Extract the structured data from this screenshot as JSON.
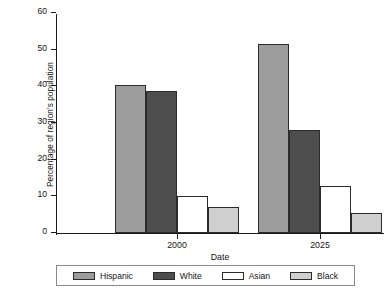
{
  "chart_data": {
    "type": "bar",
    "title": "",
    "xlabel": "Date",
    "ylabel": "Percentage of region's population",
    "categories": [
      "2000",
      "2025"
    ],
    "ylim": [
      0,
      60
    ],
    "yticks": [
      0,
      10,
      20,
      30,
      40,
      50,
      60
    ],
    "ytick_labels": [
      "0",
      "10",
      "20",
      "30",
      "40",
      "50",
      "60"
    ],
    "grid": false,
    "legend_position": "bottom",
    "series": [
      {
        "name": "Hispanic",
        "color": "#9d9d9d",
        "values": [
          40.5,
          51.5
        ]
      },
      {
        "name": "White",
        "color": "#4d4d4d",
        "values": [
          38.8,
          28.2
        ]
      },
      {
        "name": "Asian",
        "color": "#ffffff",
        "values": [
          10.0,
          12.7
        ]
      },
      {
        "name": "Black",
        "color": "#cfcfcf",
        "values": [
          7.1,
          5.5
        ]
      }
    ]
  },
  "axes": {
    "y_title": "Percentage of region's population",
    "x_title": "Date"
  },
  "colors": {
    "axis": "#1a1a1a",
    "bar_outline": "#2b2b2b",
    "legend_border": "#8a8a8a",
    "background": "#ffffff"
  }
}
